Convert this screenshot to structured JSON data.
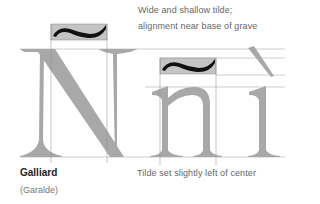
{
  "annotations": {
    "top_line1": "Wide and shallow tilde;",
    "top_line2": "alignment near base of grave",
    "bottom": "Tilde set slightly left of center"
  },
  "typeface": {
    "name": "Galliard",
    "classification": "(Garalde)"
  },
  "glyphs": {
    "capital": "N",
    "lowercase_n": "n",
    "dotless_i": "ı",
    "tilde": "~",
    "grave": "`"
  },
  "colors": {
    "glyph_fill": "#a8a8a8",
    "accent_box": "#c4c4c4",
    "accent_mark": "#111111",
    "guide_line": "#9a9a9a",
    "text": "#666666"
  }
}
